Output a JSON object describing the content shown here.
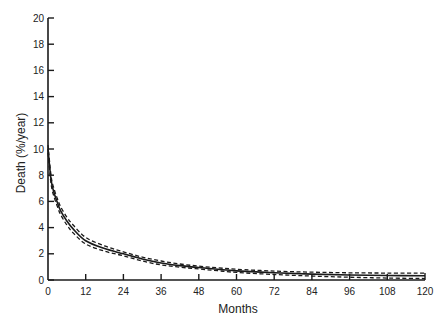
{
  "chart_data": {
    "type": "line",
    "title": "",
    "xlabel": "Months",
    "ylabel": "Death (%/year)",
    "xlim": [
      0,
      120
    ],
    "ylim": [
      0,
      20
    ],
    "x_ticks": [
      0,
      12,
      24,
      36,
      48,
      60,
      72,
      84,
      96,
      108,
      120
    ],
    "y_ticks": [
      0,
      2,
      4,
      6,
      8,
      10,
      12,
      14,
      16,
      18,
      20
    ],
    "grid": false,
    "legend": null,
    "series": [
      {
        "name": "Estimate",
        "style": "solid",
        "x": [
          0,
          1,
          2,
          3,
          4,
          6,
          8,
          12,
          18,
          24,
          30,
          36,
          42,
          48,
          54,
          60,
          72,
          84,
          96,
          108,
          120
        ],
        "values": [
          10.0,
          7.6,
          6.6,
          5.9,
          5.3,
          4.5,
          3.9,
          3.0,
          2.4,
          2.0,
          1.6,
          1.3,
          1.1,
          0.95,
          0.82,
          0.7,
          0.55,
          0.45,
          0.38,
          0.34,
          0.32
        ]
      },
      {
        "name": "Upper confidence band",
        "style": "dashed",
        "x": [
          0,
          1,
          2,
          3,
          4,
          6,
          8,
          12,
          18,
          24,
          30,
          36,
          42,
          48,
          54,
          60,
          72,
          84,
          96,
          108,
          120
        ],
        "values": [
          10.3,
          7.9,
          6.9,
          6.2,
          5.6,
          4.8,
          4.2,
          3.25,
          2.6,
          2.15,
          1.75,
          1.45,
          1.22,
          1.06,
          0.93,
          0.82,
          0.68,
          0.6,
          0.55,
          0.53,
          0.53
        ]
      },
      {
        "name": "Lower confidence band",
        "style": "dashed",
        "x": [
          0,
          1,
          2,
          3,
          4,
          6,
          8,
          12,
          18,
          24,
          30,
          36,
          42,
          48,
          54,
          60,
          72,
          84,
          96,
          108,
          120
        ],
        "values": [
          9.7,
          7.3,
          6.3,
          5.6,
          5.0,
          4.2,
          3.6,
          2.75,
          2.2,
          1.85,
          1.45,
          1.15,
          0.98,
          0.84,
          0.71,
          0.58,
          0.42,
          0.3,
          0.21,
          0.15,
          0.11
        ]
      }
    ]
  },
  "layout": {
    "plot": {
      "x0": 48,
      "x1": 425,
      "y0": 280,
      "y1": 18
    },
    "line_color": "#1a1a1a"
  }
}
